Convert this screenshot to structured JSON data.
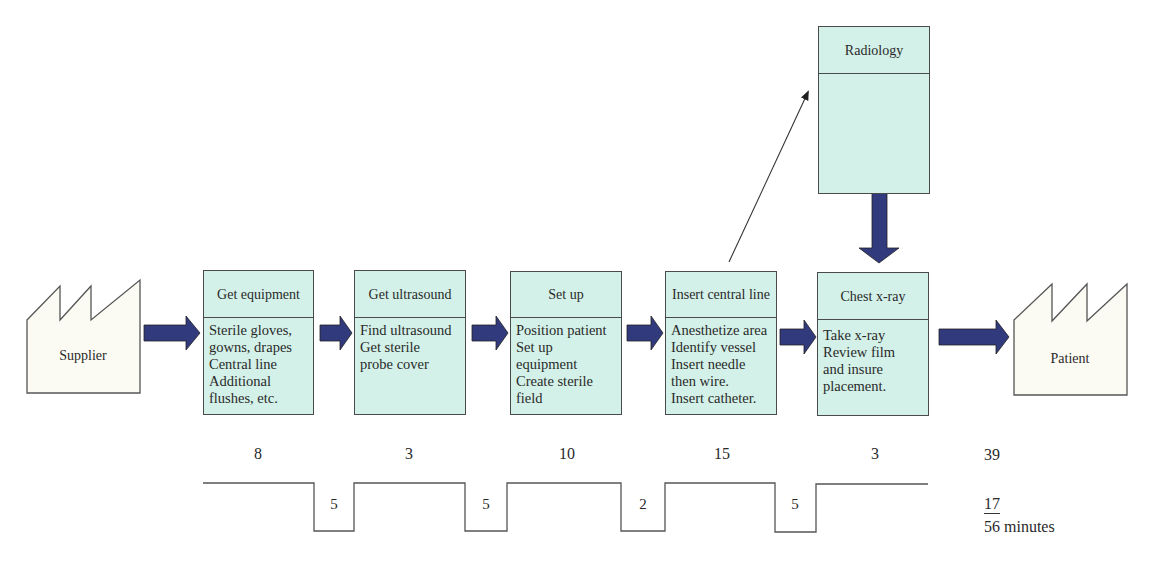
{
  "diagram": {
    "type": "value-stream-map",
    "colors": {
      "process_fill": "#d3f1e8",
      "arrow": "#323a7e",
      "border": "#4a4a4a"
    },
    "supplier": {
      "label": "Supplier",
      "icon": "factory-icon"
    },
    "customer": {
      "label": "Patient",
      "icon": "factory-icon"
    },
    "processes": [
      {
        "title": "Get equipment",
        "details": "Sterile gloves,\ngowns, drapes\nCentral line\nAdditional\nflushes, etc.",
        "time": "8"
      },
      {
        "title": "Get ultrasound",
        "details": "Find ultrasound\nGet sterile\nprobe cover",
        "time": "3"
      },
      {
        "title": "Set up",
        "details": "Position patient\nSet up\nequipment\nCreate sterile\nfield",
        "time": "10"
      },
      {
        "title": "Insert central line",
        "details": "Anesthetize area\nIdentify vessel\nInsert needle\nthen wire.\nInsert catheter.",
        "time": "15"
      },
      {
        "title": "Chest x-ray",
        "details": "Take x-ray\nReview film\nand insure\nplacement.",
        "time": "3"
      }
    ],
    "external_process": {
      "title": "Radiology",
      "details": ""
    },
    "wait_times": [
      "5",
      "5",
      "2",
      "5"
    ],
    "totals": {
      "process_time": "39",
      "wait_time": "17",
      "lead_time": "56 minutes"
    }
  }
}
